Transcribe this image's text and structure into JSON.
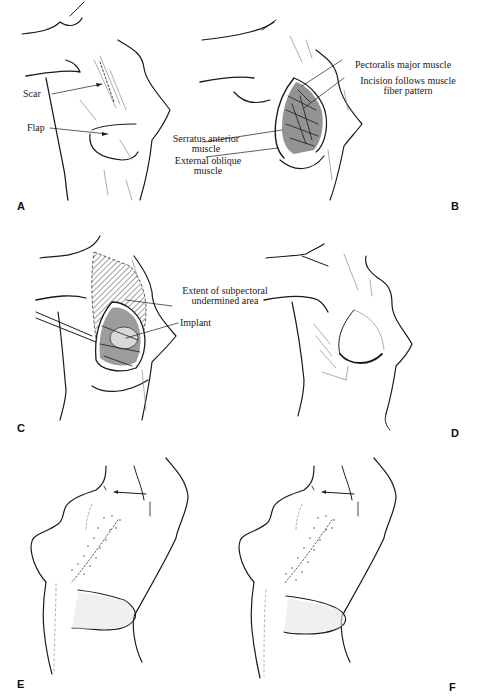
{
  "figure": {
    "panels": [
      {
        "id": "A",
        "label": "A",
        "annotations": [
          {
            "text": "Scar"
          },
          {
            "text": "Flap"
          }
        ]
      },
      {
        "id": "B",
        "label": "B",
        "annotations": [
          {
            "text": "Pectoralis major muscle"
          },
          {
            "line1": "Incision follows muscle",
            "line2": "fiber pattern"
          },
          {
            "line1": "Serratus anterior",
            "line2": "muscle"
          },
          {
            "line1": "External oblique",
            "line2": "muscle"
          }
        ]
      },
      {
        "id": "C",
        "label": "C",
        "annotations": [
          {
            "line1": "Extent of subpectoral",
            "line2": "undermined area"
          },
          {
            "text": "Implant"
          }
        ]
      },
      {
        "id": "D",
        "label": "D",
        "annotations": []
      },
      {
        "id": "E",
        "label": "E",
        "annotations": []
      },
      {
        "id": "F",
        "label": "F",
        "annotations": []
      }
    ]
  }
}
